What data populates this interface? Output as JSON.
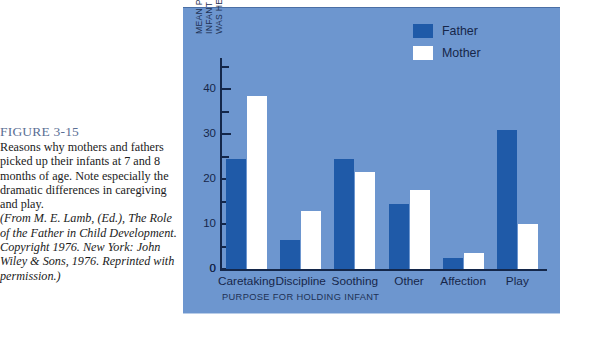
{
  "caption": {
    "figure_number": "FIGURE 3-15",
    "body": "Reasons why mothers and fathers picked up their infants at 7 and 8 months of age. Note especially the dramatic differences in caregiving and play.",
    "source": "(From M. E. Lamb, (Ed.), The Role of the Father in Child Development. Copyright 1976. New York: John Wiley & Sons, 1976. Reprinted with permission.)"
  },
  "colors": {
    "panel_background": "#6d96cf",
    "father_bar": "#1f5aa8",
    "mother_bar": "#ffffff",
    "axis": "#14274a",
    "heading": "#5b6f94"
  },
  "legend": {
    "position": "top-right",
    "items": [
      {
        "label": "Father",
        "swatch": "father"
      },
      {
        "label": "Mother",
        "swatch": "mother"
      }
    ]
  },
  "axes": {
    "y_title_line1": "MEAN PERCENTAGE OF OCCASIONS THAT INFANT",
    "y_title_line2": "WAS HELD BY THE PARENT",
    "x_title": "PURPOSE FOR HOLDING INFANT",
    "y_tick_labels": [
      "0",
      "10",
      "20",
      "30",
      "40"
    ],
    "y_minor_ticks": [
      "5",
      "15",
      "25",
      "35",
      "45"
    ]
  },
  "chart_data": {
    "type": "bar",
    "title": "",
    "xlabel": "PURPOSE FOR HOLDING INFANT",
    "ylabel": "MEAN PERCENTAGE OF OCCASIONS THAT INFANT WAS HELD BY THE PARENT",
    "categories": [
      "Caretaking",
      "Discipline",
      "Soothing",
      "Other",
      "Affection",
      "Play"
    ],
    "series": [
      {
        "name": "Father",
        "values": [
          24.5,
          6.5,
          24.5,
          14.5,
          2.5,
          31
        ]
      },
      {
        "name": "Mother",
        "values": [
          38.5,
          13,
          21.5,
          17.5,
          3.5,
          10
        ]
      }
    ],
    "ylim": [
      0,
      47
    ],
    "ytick_interval": 10,
    "yminor_interval": 5,
    "grid": false,
    "legend_position": "top-right"
  }
}
